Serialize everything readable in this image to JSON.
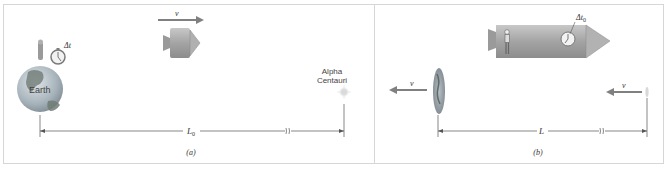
{
  "figure": {
    "panel_a": {
      "caption": "(a)",
      "earth_label": "Earth",
      "clock_label": "Δt",
      "velocity_label": "v",
      "star_label_line1": "Alpha",
      "star_label_line2": "Centauri",
      "distance_label": "L",
      "distance_subscript": "0"
    },
    "panel_b": {
      "caption": "(b)",
      "clock_label": "Δt",
      "clock_subscript": "0",
      "velocity_left_label": "v",
      "velocity_right_label": "v",
      "distance_label": "L"
    },
    "colors": {
      "border": "#d6d6d6",
      "arrow": "#808080",
      "ship": "#a9a9a9",
      "ship_dark": "#8a8a8a",
      "line": "#555555",
      "earth_ocean": "#9aa6b0",
      "earth_land": "#6e7a6e"
    }
  }
}
